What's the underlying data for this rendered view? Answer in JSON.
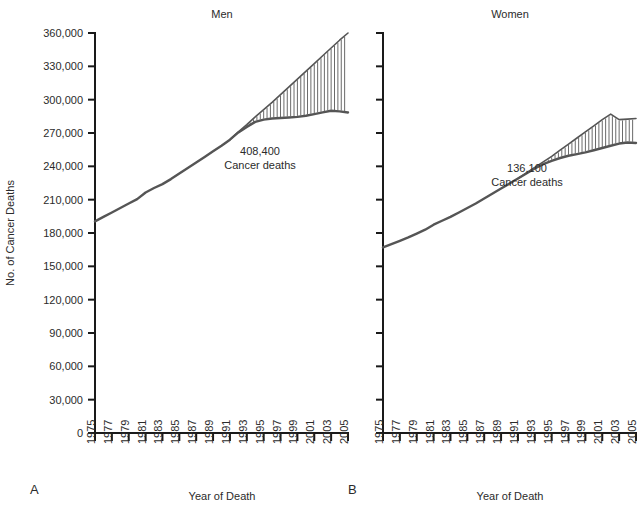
{
  "figure": {
    "y_axis_title": "No. of Cancer Deaths",
    "x_axis_title_a": "Year of Death",
    "x_axis_title_b": "Year of Death",
    "panel_letter_a": "A",
    "panel_letter_b": "B"
  },
  "panels": [
    {
      "id": "men",
      "letter": "A",
      "title": "Men",
      "annotation_value": "408,400",
      "annotation_label": "Cancer deaths",
      "show_y_labels": true
    },
    {
      "id": "women",
      "letter": "B",
      "title": "Women",
      "annotation_value": "136,100",
      "annotation_label": "Cancer deaths",
      "show_y_labels": false
    }
  ],
  "chart_data": {
    "type": "line",
    "xlabel": "Year of Death",
    "ylabel": "No. of Cancer Deaths",
    "xlim": [
      1975,
      2005
    ],
    "ylim": [
      0,
      360000
    ],
    "ytick_values": [
      0,
      30000,
      60000,
      90000,
      120000,
      150000,
      180000,
      210000,
      240000,
      270000,
      300000,
      330000,
      360000
    ],
    "ytick_labels": [
      "0",
      "30,000",
      "60,000",
      "90,000",
      "120,000",
      "150,000",
      "180,000",
      "210,000",
      "240,000",
      "270,000",
      "300,000",
      "330,000",
      "360,000"
    ],
    "xtick_values": [
      1975,
      1977,
      1979,
      1981,
      1983,
      1985,
      1987,
      1989,
      1991,
      1993,
      1995,
      1997,
      1999,
      2001,
      2003,
      2005
    ],
    "xtick_labels": [
      "1975",
      "1977",
      "1979",
      "1981",
      "1983",
      "1985",
      "1987",
      "1989",
      "1991",
      "1993",
      "1995",
      "1997",
      "1999",
      "2001",
      "2003",
      "2005"
    ],
    "grid": false,
    "legend": "none",
    "annotations": [
      {
        "panel": "men",
        "text": "408,400 Cancer deaths",
        "value": 408400
      },
      {
        "panel": "women",
        "text": "136,100 Cancer deaths",
        "value": 136100
      }
    ],
    "panels": [
      {
        "name": "Men",
        "x": [
          1975,
          1976,
          1977,
          1978,
          1979,
          1980,
          1981,
          1982,
          1983,
          1984,
          1985,
          1986,
          1987,
          1988,
          1989,
          1990,
          1991,
          1992,
          1993,
          1994,
          1995,
          1996,
          1997,
          1998,
          1999,
          2000,
          2001,
          2002,
          2003,
          2004,
          2005
        ],
        "series": [
          {
            "name": "Observed cancer deaths",
            "values": [
              190500,
              194500,
              198500,
              202500,
              206500,
              210500,
              216500,
              220500,
              224000,
              228500,
              233500,
              238500,
              243500,
              248500,
              253500,
              258500,
              264000,
              270500,
              275500,
              280000,
              282000,
              283000,
              283500,
              284000,
              284500,
              285500,
              287000,
              288500,
              290000,
              289500,
              288500
            ]
          },
          {
            "name": "Projected cancer deaths (if 1990 rates had continued)",
            "values": [
              null,
              null,
              null,
              null,
              null,
              null,
              null,
              null,
              null,
              null,
              null,
              null,
              null,
              null,
              null,
              null,
              264000,
              271000,
              277500,
              284500,
              291000,
              297500,
              304500,
              311500,
              318500,
              325500,
              332500,
              339500,
              346500,
              353500,
              360000
            ]
          }
        ],
        "shaded_region": {
          "label": "Cancer deaths averted",
          "between": [
            "Projected cancer deaths (if 1990 rates had continued)",
            "Observed cancer deaths"
          ],
          "from_year": 1991,
          "to_year": 2005,
          "style": "vertical-hatch"
        }
      },
      {
        "name": "Women",
        "x": [
          1975,
          1976,
          1977,
          1978,
          1979,
          1980,
          1981,
          1982,
          1983,
          1984,
          1985,
          1986,
          1987,
          1988,
          1989,
          1990,
          1991,
          1992,
          1993,
          1994,
          1995,
          1996,
          1997,
          1998,
          1999,
          2000,
          2001,
          2002,
          2003,
          2004,
          2005
        ],
        "series": [
          {
            "name": "Observed cancer deaths",
            "values": [
              167000,
              170000,
              173000,
              176000,
              179500,
              183000,
              187500,
              191000,
              194500,
              198500,
              202500,
              206500,
              211000,
              215500,
              220000,
              224500,
              229000,
              233500,
              238000,
              242000,
              245000,
              247500,
              249500,
              251000,
              252500,
              254500,
              256500,
              258500,
              260500,
              261500,
              261000
            ]
          },
          {
            "name": "Projected cancer deaths (if 1990 rates had continued)",
            "values": [
              null,
              null,
              null,
              null,
              null,
              null,
              null,
              null,
              null,
              null,
              null,
              null,
              null,
              null,
              null,
              null,
              229000,
              234000,
              239000,
              244000,
              249000,
              254500,
              260000,
              265500,
              271000,
              276500,
              282000,
              287000,
              282000,
              282500,
              283000
            ]
          }
        ],
        "shaded_region": {
          "label": "Cancer deaths averted",
          "between": [
            "Projected cancer deaths (if 1990 rates had continued)",
            "Observed cancer deaths"
          ],
          "from_year": 1991,
          "to_year": 2005,
          "style": "vertical-hatch"
        }
      }
    ]
  }
}
